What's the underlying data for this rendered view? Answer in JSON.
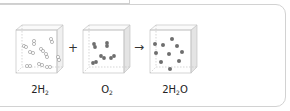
{
  "diagram": {
    "operators": {
      "plus": "+",
      "arrow": "→"
    },
    "boxes": [
      {
        "id": "hydrogen",
        "label_main": "2H",
        "label_sub": "2",
        "label_tail": "",
        "molecule_style": "hollow-pairs",
        "molecule_color": "#ffffff",
        "outline_color": "#9a9a9a"
      },
      {
        "id": "oxygen",
        "label_main": "O",
        "label_sub": "2",
        "label_tail": "",
        "molecule_style": "filled-pairs",
        "molecule_color": "#6e6e6e"
      },
      {
        "id": "water",
        "label_main": "2H",
        "label_sub": "2",
        "label_tail": "O",
        "molecule_style": "filled-single",
        "molecule_color": "#6e6e6e"
      }
    ]
  },
  "colors": {
    "box_edge": "#bdbdbd",
    "side_face": "#e6e6e6",
    "panel_border": "#d2d2d2"
  }
}
